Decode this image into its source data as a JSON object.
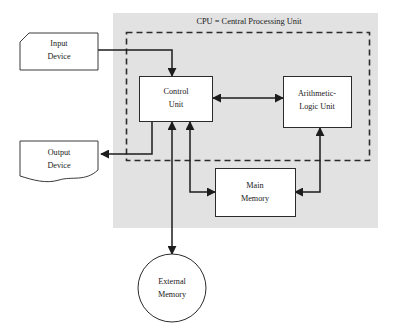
{
  "diagram": {
    "cpu_label": "CPU = Central Processing Unit",
    "colors": {
      "cpu_background": "#e2e2e2",
      "node_fill": "#ffffff",
      "stroke": "#1d1d1d",
      "page_background": "#ffffff"
    },
    "nodes": {
      "input_device": {
        "label_line1": "Input",
        "label_line2": "Device",
        "shape": "cut-corner-rectangle"
      },
      "output_device": {
        "label_line1": "Output",
        "label_line2": "Device",
        "shape": "document-wavy-bottom"
      },
      "control_unit": {
        "label_line1": "Control",
        "label_line2": "Unit",
        "shape": "rectangle"
      },
      "alu": {
        "label_line1": "Arithmetic-",
        "label_line2": "Logic Unit",
        "shape": "rectangle"
      },
      "main_memory": {
        "label_line1": "Main",
        "label_line2": "Memory",
        "shape": "rectangle"
      },
      "external_memory": {
        "label_line1": "External",
        "label_line2": "Memory",
        "shape": "circle"
      }
    },
    "connections": [
      {
        "name": "input-to-control-unit",
        "from": "input_device",
        "to": "control_unit",
        "direction": "one-way"
      },
      {
        "name": "control-unit-to-output",
        "from": "control_unit",
        "to": "output_device",
        "direction": "one-way"
      },
      {
        "name": "control-unit-to-alu",
        "from": "control_unit",
        "to": "alu",
        "direction": "two-way"
      },
      {
        "name": "control-unit-to-main-memory",
        "from": "control_unit",
        "to": "main_memory",
        "direction": "two-way"
      },
      {
        "name": "main-memory-to-alu",
        "from": "main_memory",
        "to": "alu",
        "direction": "two-way"
      },
      {
        "name": "control-unit-to-external-memory",
        "from": "control_unit",
        "to": "external_memory",
        "direction": "two-way"
      }
    ]
  }
}
